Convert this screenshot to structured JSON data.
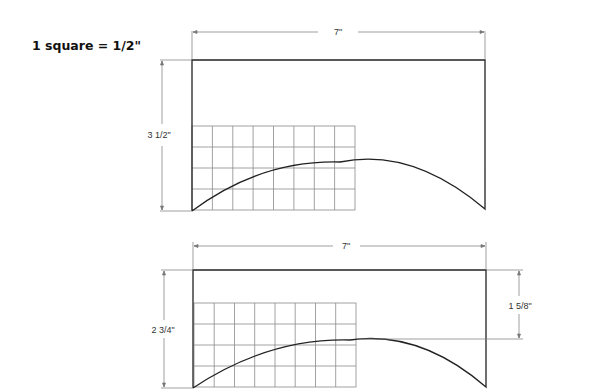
{
  "scale_note": "1 square = 1/2\"",
  "patterns": [
    {
      "name": "top-pattern",
      "width_label": "7\"",
      "height_label": "3 1/2\"",
      "grid": {
        "columns": 8,
        "rows": 4
      }
    },
    {
      "name": "bottom-pattern",
      "width_label": "7\"",
      "height_label": "2 3/4\"",
      "side_label": "1 5/8\"",
      "grid": {
        "columns": 8,
        "rows": 4
      }
    }
  ],
  "colors": {
    "outline": "#222222",
    "grid": "#8a8a8a",
    "dimension": "#777777"
  }
}
